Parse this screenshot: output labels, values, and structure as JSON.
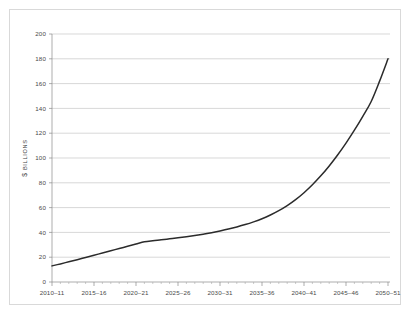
{
  "chart_data": {
    "type": "line",
    "title": "",
    "subtitle": "",
    "xlabel": "",
    "ylabel": "$ BILLIONS",
    "ylabel_currency": "$",
    "ylabel_units": "BILLIONS",
    "xlim_labels": [
      "2010–11",
      "2050–51"
    ],
    "ylim": [
      0,
      200
    ],
    "grid": true,
    "legend": "none",
    "y_ticks": [
      0,
      20,
      40,
      60,
      80,
      100,
      120,
      140,
      160,
      180,
      200
    ],
    "y_tick_labels": [
      "0",
      "20",
      "40",
      "60",
      "80",
      "100",
      "120",
      "140",
      "160",
      "180",
      "200"
    ],
    "x_tick_labels": [
      "2010–11",
      "2015–16",
      "2020–21",
      "2025–26",
      "2030–31",
      "2035–36",
      "2040–41",
      "2045–46",
      "2050–51"
    ],
    "x_tick_values": [
      2010,
      2015,
      2020,
      2025,
      2030,
      2035,
      2040,
      2045,
      2050
    ],
    "x_minor_interval": 1,
    "series": [
      {
        "name": "Projected spending",
        "color": "#2b2b2b",
        "x": [
          2010,
          2011,
          2012,
          2013,
          2014,
          2015,
          2016,
          2017,
          2018,
          2019,
          2020,
          2021,
          2022,
          2023,
          2024,
          2025,
          2026,
          2027,
          2028,
          2029,
          2030,
          2031,
          2032,
          2033,
          2034,
          2035,
          2036,
          2037,
          2038,
          2039,
          2040,
          2041,
          2042,
          2043,
          2044,
          2045,
          2046,
          2047,
          2048,
          2049,
          2050
        ],
        "values": [
          13.0,
          14.6,
          16.3,
          18.0,
          19.8,
          21.6,
          23.4,
          25.2,
          27.0,
          28.8,
          30.6,
          32.4,
          33.3,
          34.0,
          34.8,
          35.6,
          36.5,
          37.5,
          38.6,
          39.8,
          41.2,
          42.7,
          44.4,
          46.3,
          48.5,
          51.0,
          54.0,
          57.5,
          61.6,
          66.4,
          72.0,
          78.4,
          85.6,
          93.6,
          102.4,
          112.0,
          122.4,
          133.6,
          145.6,
          162.0,
          180.0
        ]
      }
    ]
  },
  "axis": {
    "y_title_currency": "$",
    "y_title_units": "BILLIONS"
  }
}
